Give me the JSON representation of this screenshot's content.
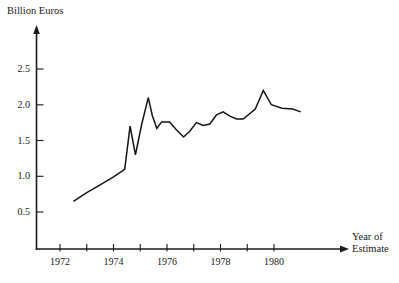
{
  "chart_data": {
    "type": "line",
    "title": "",
    "xlabel": "Year of Estimate",
    "ylabel": "Billion Euros",
    "xlim": [
      1971.2,
      1981.4
    ],
    "ylim": [
      0,
      2.82
    ],
    "grid": false,
    "legend": null,
    "x_ticks_major": [
      1972,
      1974,
      1976,
      1978,
      1980
    ],
    "x_tick_labels": [
      "1972",
      "1974",
      "1976",
      "1978",
      "1980"
    ],
    "x_ticks_minor": [
      1972.5,
      1973,
      1973.5,
      1974.5,
      1975,
      1975.5,
      1976.5,
      1977,
      1977.5,
      1978.5,
      1979,
      1979.5
    ],
    "y_ticks": [
      0.5,
      1.0,
      1.5,
      2.0,
      2.5
    ],
    "y_tick_labels": [
      "0.5",
      "1.0",
      "1.5",
      "2.0",
      "2.5"
    ],
    "series": [
      {
        "name": "Cost estimate",
        "x": [
          1972.5,
          1973.0,
          1973.5,
          1974.0,
          1974.35,
          1974.42,
          1974.62,
          1974.82,
          1975.05,
          1975.3,
          1975.45,
          1975.62,
          1975.8,
          1976.1,
          1976.35,
          1976.62,
          1976.85,
          1977.1,
          1977.35,
          1977.6,
          1977.85,
          1978.1,
          1978.35,
          1978.6,
          1978.85,
          1979.3,
          1979.45,
          1979.6,
          1979.9,
          1980.3,
          1980.7,
          1981.0
        ],
        "y": [
          0.65,
          0.77,
          0.88,
          0.99,
          1.08,
          1.1,
          1.7,
          1.3,
          1.72,
          2.1,
          1.85,
          1.67,
          1.76,
          1.76,
          1.65,
          1.55,
          1.63,
          1.75,
          1.71,
          1.73,
          1.86,
          1.9,
          1.84,
          1.8,
          1.8,
          1.94,
          2.07,
          2.2,
          2.0,
          1.95,
          1.94,
          1.9
        ]
      }
    ],
    "annotations": []
  },
  "axis": {
    "y_title": "Billion Euros",
    "x_title_line1": "Year of",
    "x_title_line2": "Estimate"
  }
}
